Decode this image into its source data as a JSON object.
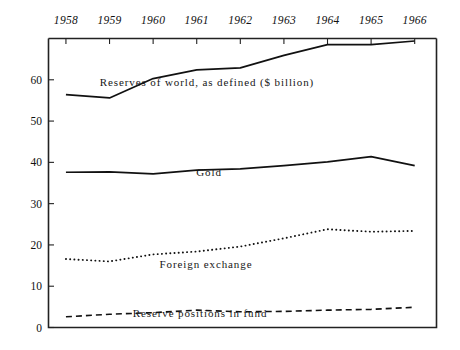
{
  "chart_data": {
    "type": "line",
    "title": "",
    "xlabel": "",
    "ylabel": "",
    "x": [
      1958,
      1959,
      1960,
      1961,
      1962,
      1963,
      1964,
      1965,
      1966
    ],
    "xtick_labels": [
      "1958",
      "1959",
      "1960",
      "1961",
      "1962",
      "1963",
      "1964",
      "1965",
      "1966"
    ],
    "ytick_labels": [
      "0",
      "10",
      "20",
      "30",
      "40",
      "50",
      "60"
    ],
    "ytick_values": [
      0,
      10,
      20,
      30,
      40,
      50,
      60
    ],
    "ylim": [
      0,
      70
    ],
    "xlim": [
      1957.6,
      1966.5
    ],
    "grid": false,
    "legend_position": "inline-annotations",
    "xaxis_position": "top",
    "series": [
      {
        "name": "Reserves of world, as defined ($ billion)",
        "style": "solid",
        "color": "#111111",
        "values": [
          56.4,
          55.6,
          60.3,
          62.4,
          62.9,
          65.9,
          68.5,
          68.5,
          69.4
        ]
      },
      {
        "name": "Gold",
        "style": "solid",
        "color": "#111111",
        "values": [
          37.6,
          37.7,
          37.2,
          38.1,
          38.4,
          39.2,
          40.1,
          41.4,
          39.2
        ]
      },
      {
        "name": "Foreign exchange",
        "style": "dotted",
        "color": "#111111",
        "values": [
          16.6,
          16.0,
          17.7,
          18.4,
          19.6,
          21.6,
          23.8,
          23.2,
          23.4
        ]
      },
      {
        "name": "Reserve positions in fund",
        "style": "dashed",
        "color": "#111111",
        "values": [
          2.6,
          3.2,
          3.6,
          4.2,
          3.8,
          3.9,
          4.2,
          4.4,
          4.9
        ]
      }
    ],
    "annotations": [
      {
        "text": "Reserves of world, as defined ($ billion)",
        "x": 207,
        "y": 82
      },
      {
        "text": "Gold",
        "x": 209,
        "y": 172
      },
      {
        "text": "Foreign exchange",
        "x": 206,
        "y": 264
      },
      {
        "text": "Reserve positions in fund",
        "x": 200,
        "y": 313
      }
    ]
  },
  "axis": {
    "line_color": "#222222",
    "frame": true
  }
}
